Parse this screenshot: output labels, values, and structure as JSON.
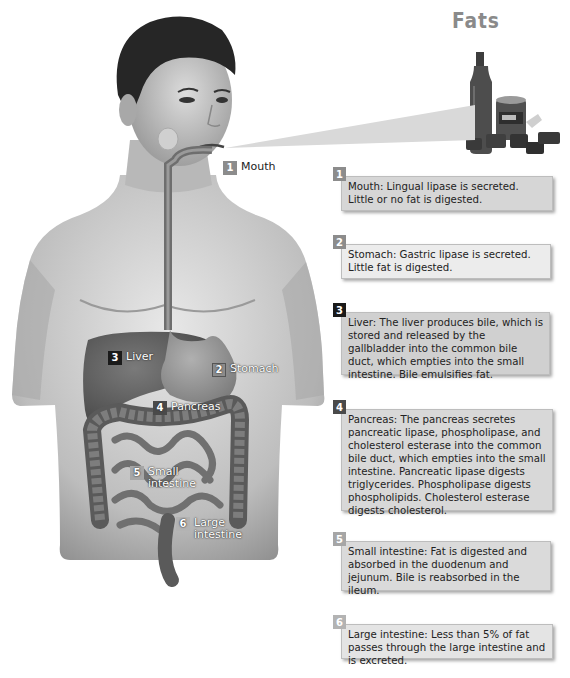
{
  "title": "Fats",
  "colors": {
    "badge_1": "#8c8c8c",
    "badge_2": "#8c8c8c",
    "badge_3": "#1a1a1a",
    "badge_4": "#4a4a4a",
    "badge_5": "#a6a6a6",
    "badge_6": "#b3b3b3",
    "box_1": "#d6d6d6",
    "box_2": "#ececec",
    "box_3": "#d0d0d0",
    "box_4": "#d8d8d8",
    "box_5": "#dadada",
    "box_6": "#e4e4e4"
  },
  "figure_labels": [
    {
      "number": "1",
      "label": "Mouth"
    },
    {
      "number": "2",
      "label": "Stomach"
    },
    {
      "number": "3",
      "label": "Liver"
    },
    {
      "number": "4",
      "label": "Pancreas"
    },
    {
      "number": "5",
      "label": "Small intestine",
      "line1": "Small",
      "line2": "intestine"
    },
    {
      "number": "6",
      "label": "Large intestine",
      "line1": "Large",
      "line2": "intestine"
    }
  ],
  "steps": [
    {
      "number": "1",
      "text": "Mouth: Lingual lipase is secreted. Little or no fat is digested."
    },
    {
      "number": "2",
      "text": "Stomach: Gastric lipase is secreted. Little fat is digested."
    },
    {
      "number": "3",
      "text": "Liver: The liver produces bile, which is stored and released by the gallbladder into the common bile duct, which empties into the small intestine. Bile emulsifies fat."
    },
    {
      "number": "4",
      "text": "Pancreas: The pancreas secretes pancreatic lipase, phospholipase, and cholesterol esterase into the common bile duct, which empties into the small intestine. Pancreatic lipase digests triglycerides. Phospholipase digests phospholipids. Cholesterol esterase digests cholesterol."
    },
    {
      "number": "5",
      "text": "Small intestine: Fat is digested and absorbed in the duodenum and jejunum. Bile is reabsorbed in the ileum."
    },
    {
      "number": "6",
      "text": "Large intestine: Less than 5% of fat passes through the large intestine and is excreted."
    }
  ]
}
